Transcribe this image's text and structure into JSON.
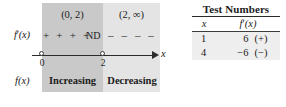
{
  "sign_chart": {
    "intervals": [
      {
        "label": "(0, 2)",
        "sign_marks": "+ + + +",
        "behavior": "Increasing"
      },
      {
        "label": "(2, ∞)",
        "sign_marks": "– – – –",
        "behavior": "Decreasing"
      }
    ],
    "derivative_row_label": "f'(x)",
    "derivative_row_label_base": "f",
    "derivative_row_label_prime": "′",
    "derivative_row_label_arg": "(x)",
    "function_row_label": "f(x)",
    "undefined_marker": "ND",
    "axis_variable": "x",
    "tick_values": [
      "0",
      "2"
    ],
    "colors": {
      "shade_dark": "#c9c9c9",
      "shade_light": "#e4e4e4",
      "axis": "#2b2b2b",
      "text": "#1b1b1b"
    }
  },
  "test_numbers": {
    "title": "Test Numbers",
    "columns": {
      "x": "x",
      "fprime_base": "f",
      "fprime_prime": "′",
      "fprime_arg": "(x)"
    },
    "rows": [
      {
        "x": "1",
        "value": "6",
        "sign": "(+)"
      },
      {
        "x": "4",
        "value": "−6",
        "sign": "(−)"
      }
    ],
    "row_background": "#eeeeee"
  }
}
